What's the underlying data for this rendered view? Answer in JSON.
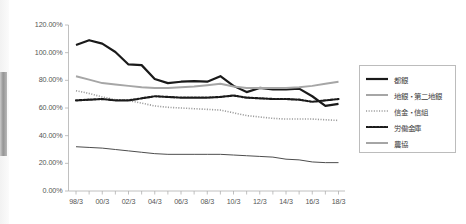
{
  "chart_data": {
    "type": "line",
    "title": "",
    "subtitle": "",
    "xlabel": "",
    "ylabel": "",
    "grid": false,
    "legend_position": "right",
    "ylim": [
      0,
      120
    ],
    "ytick_labels": [
      "0.00%",
      "20.00%",
      "40.00%",
      "60.00%",
      "80.00%",
      "100.00%",
      "120.00%"
    ],
    "ytick_values": [
      0,
      20,
      40,
      60,
      80,
      100,
      120
    ],
    "x": [
      "98/3",
      "99/3",
      "00/3",
      "01/3",
      "02/3",
      "03/3",
      "04/3",
      "05/3",
      "06/3",
      "07/3",
      "08/3",
      "09/3",
      "10/3",
      "11/3",
      "12/3",
      "13/3",
      "14/3",
      "15/3",
      "16/3",
      "17/3",
      "18/3"
    ],
    "xtick_labels": [
      "98/3",
      "00/3",
      "02/3",
      "04/3",
      "06/3",
      "08/3",
      "10/3",
      "12/3",
      "14/3",
      "16/3",
      "18/3"
    ],
    "xtick_label_step": 2,
    "series": [
      {
        "name": "都銀",
        "color": "#1a1a1a",
        "style": "solid",
        "width": 2.2,
        "values": [
          105.5,
          109.0,
          106.5,
          100.5,
          91.5,
          91.0,
          81.0,
          78.0,
          79.0,
          79.5,
          79.0,
          83.0,
          76.0,
          71.5,
          74.5,
          73.5,
          73.5,
          74.0,
          68.5,
          61.5,
          63.0
        ]
      },
      {
        "name": "地銀・第二地銀",
        "color": "#a6a6a6",
        "style": "solid",
        "width": 2.0,
        "values": [
          83.0,
          80.5,
          78.0,
          77.0,
          76.0,
          75.0,
          74.5,
          74.5,
          75.0,
          75.5,
          76.5,
          77.5,
          75.5,
          74.5,
          74.5,
          74.5,
          74.5,
          75.0,
          76.0,
          77.5,
          79.0
        ]
      },
      {
        "name": "信金・信組",
        "color": "#9b9b9b",
        "style": "dotted-fine",
        "width": 1.6,
        "values": [
          72.5,
          70.5,
          68.0,
          66.0,
          65.5,
          63.5,
          61.5,
          60.5,
          60.0,
          59.5,
          59.0,
          58.5,
          56.5,
          54.5,
          53.5,
          52.5,
          52.0,
          52.0,
          52.0,
          51.5,
          51.0
        ]
      },
      {
        "name": "労働金庫",
        "color": "#1a1a1a",
        "style": "dotted-bold",
        "width": 2.2,
        "values": [
          65.5,
          66.0,
          66.5,
          65.5,
          65.5,
          67.0,
          68.5,
          68.0,
          67.5,
          67.5,
          67.5,
          68.0,
          69.0,
          67.5,
          67.0,
          66.5,
          66.5,
          66.0,
          64.5,
          65.5,
          66.5
        ]
      },
      {
        "name": "農協",
        "color": "#4d4d4d",
        "style": "solid",
        "width": 1.0,
        "values": [
          32.0,
          31.5,
          31.0,
          30.0,
          29.0,
          28.0,
          27.0,
          26.5,
          26.5,
          26.5,
          26.5,
          26.5,
          26.0,
          25.5,
          25.0,
          24.5,
          23.0,
          22.5,
          21.0,
          20.5,
          20.5
        ]
      }
    ]
  },
  "axis": {
    "axis_color": "#b0b0b0",
    "tick_color": "#b0b0b0"
  },
  "legend": {
    "items": [
      {
        "label": "都銀"
      },
      {
        "label": "地銀・第二地銀"
      },
      {
        "label": "信金・信組"
      },
      {
        "label": "労働金庫"
      },
      {
        "label": "農協"
      }
    ]
  }
}
